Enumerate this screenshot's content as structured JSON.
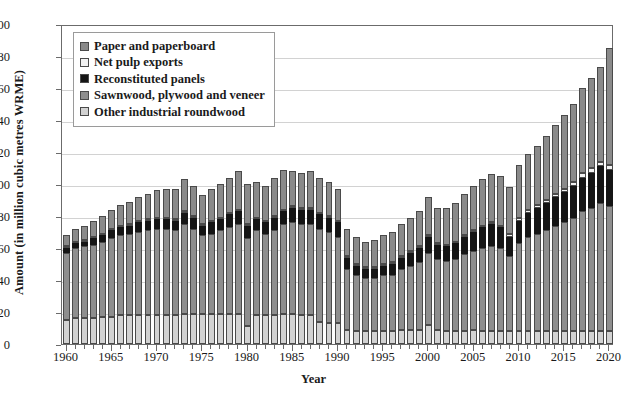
{
  "chart_data": {
    "type": "bar",
    "stacked": true,
    "title": "",
    "xlabel": "Year",
    "ylabel": "Amount (in million cubic metres WRME)",
    "ylim": [
      0,
      200
    ],
    "ytick_values": [
      0,
      20,
      40,
      60,
      80,
      100,
      120,
      140,
      160,
      180,
      200
    ],
    "xlim": [
      1960,
      2020
    ],
    "xtick_labels": [
      "1960",
      "1965",
      "1970",
      "1975",
      "1980",
      "1985",
      "1990",
      "1995",
      "2000",
      "2005",
      "2010",
      "2015",
      "2020"
    ],
    "grid": "horizontal",
    "legend_position": "top-left",
    "legend_order_top_to_bottom": [
      "Paper and paperboard",
      "Net pulp exports",
      "Reconstituted panels",
      "Sawnwood, plywood and veneer",
      "Other industrial roundwood"
    ],
    "stack_order_bottom_to_top": [
      "Other industrial roundwood",
      "Sawnwood, plywood and veneer",
      "Reconstituted panels",
      "Net pulp exports",
      "Paper and paperboard"
    ],
    "colors": {
      "Paper and paperboard": "#8a8a8a",
      "Net pulp exports": "#f2f2f2",
      "Reconstituted panels": "#151515",
      "Sawnwood, plywood and veneer": "#8e8e8e",
      "Other industrial roundwood": "#d2d2d2"
    },
    "x": [
      1960,
      1961,
      1962,
      1963,
      1964,
      1965,
      1966,
      1967,
      1968,
      1969,
      1970,
      1971,
      1972,
      1973,
      1974,
      1975,
      1976,
      1977,
      1978,
      1979,
      1980,
      1981,
      1982,
      1983,
      1984,
      1985,
      1986,
      1987,
      1988,
      1989,
      1990,
      1991,
      1992,
      1993,
      1994,
      1995,
      1996,
      1997,
      1998,
      1999,
      2000,
      2001,
      2002,
      2003,
      2004,
      2005,
      2006,
      2007,
      2008,
      2009,
      2010,
      2011,
      2012,
      2013,
      2014,
      2015,
      2016,
      2017,
      2018,
      2019,
      2020
    ],
    "series": [
      {
        "name": "Other industrial roundwood",
        "values": [
          15,
          16,
          16,
          16,
          17,
          17,
          18,
          18,
          18,
          18,
          18,
          18,
          18,
          19,
          19,
          19,
          19,
          19,
          19,
          19,
          11,
          18,
          18,
          18,
          19,
          19,
          18,
          18,
          14,
          13,
          13,
          9,
          8,
          8,
          8,
          8,
          8,
          9,
          9,
          9,
          12,
          9,
          8,
          8,
          8,
          9,
          8,
          8,
          8,
          8,
          8,
          8,
          8,
          8,
          8,
          8,
          8,
          8,
          8,
          8,
          8
        ]
      },
      {
        "name": "Sawnwood, plywood and veneer",
        "values": [
          42,
          44,
          45,
          46,
          47,
          49,
          50,
          51,
          52,
          53,
          54,
          54,
          53,
          56,
          53,
          49,
          50,
          52,
          54,
          56,
          55,
          53,
          51,
          53,
          56,
          57,
          57,
          57,
          58,
          57,
          54,
          38,
          35,
          33,
          33,
          35,
          35,
          38,
          40,
          42,
          45,
          44,
          44,
          45,
          48,
          49,
          52,
          53,
          52,
          47,
          55,
          59,
          61,
          63,
          66,
          68,
          71,
          75,
          77,
          80,
          78
        ]
      },
      {
        "name": "Reconstituted panels",
        "values": [
          3,
          3,
          3,
          4,
          4,
          5,
          5,
          5,
          6,
          6,
          6,
          6,
          6,
          7,
          7,
          6,
          7,
          7,
          8,
          8,
          8,
          7,
          7,
          8,
          8,
          9,
          9,
          9,
          9,
          9,
          9,
          7,
          6,
          6,
          6,
          6,
          7,
          7,
          8,
          9,
          10,
          9,
          9,
          10,
          11,
          12,
          13,
          14,
          13,
          12,
          14,
          15,
          16,
          17,
          18,
          19,
          20,
          21,
          22,
          23,
          23
        ]
      },
      {
        "name": "Net pulp exports",
        "values": [
          1,
          1,
          1,
          1,
          1,
          1,
          1,
          1,
          1,
          1,
          1,
          1,
          1,
          1,
          1,
          1,
          1,
          1,
          1,
          1,
          1,
          1,
          1,
          1,
          1,
          1,
          1,
          1,
          1,
          1,
          1,
          1,
          1,
          1,
          1,
          1,
          1,
          1,
          1,
          1,
          1,
          1,
          1,
          1,
          1,
          1,
          1,
          1,
          1,
          2,
          2,
          2,
          2,
          2,
          2,
          2,
          2,
          3,
          3,
          3,
          3
        ]
      },
      {
        "name": "Paper and paperboard",
        "values": [
          7,
          8,
          9,
          10,
          11,
          12,
          13,
          14,
          15,
          16,
          17,
          18,
          19,
          20,
          19,
          18,
          20,
          21,
          22,
          24,
          25,
          22,
          22,
          24,
          25,
          22,
          22,
          23,
          22,
          21,
          20,
          17,
          17,
          16,
          17,
          18,
          19,
          20,
          21,
          22,
          24,
          22,
          23,
          24,
          26,
          28,
          29,
          30,
          31,
          29,
          33,
          35,
          37,
          40,
          43,
          46,
          49,
          53,
          56,
          59,
          73
        ]
      }
    ]
  },
  "legend": {
    "items": [
      {
        "label": "Paper and paperboard",
        "swatch": "#8a8a8a"
      },
      {
        "label": "Net pulp exports",
        "swatch": "#f2f2f2"
      },
      {
        "label": "Reconstituted panels",
        "swatch": "#151515"
      },
      {
        "label": "Sawnwood, plywood and veneer",
        "swatch": "#8e8e8e"
      },
      {
        "label": "Other industrial roundwood",
        "swatch": "#d2d2d2"
      }
    ]
  }
}
